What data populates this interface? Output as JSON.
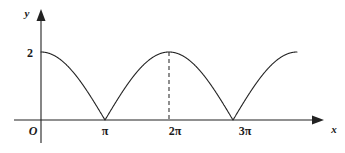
{
  "figure": {
    "background_color": "#ffffff",
    "curve_color": "#222222",
    "axis_color": "#222222",
    "guide_color": "#333333"
  },
  "axes": {
    "y_axis_label": "y",
    "x_axis_label": "x",
    "origin_label": "O"
  },
  "y_ticks": [
    {
      "label": "2",
      "value": 2
    }
  ],
  "x_ticks": [
    {
      "label": "π",
      "value": 3.14159
    },
    {
      "label": "2π",
      "value": 6.28319
    },
    {
      "label": "3π",
      "value": 9.42478
    }
  ],
  "annotations": [
    {
      "name": "peak-guide-line",
      "type": "dashed-vertical",
      "x": 6.28319,
      "y_from": 0,
      "y_to": 2
    }
  ],
  "chart_data": {
    "type": "line",
    "title": "",
    "subtitle": "",
    "xlabel": "x",
    "ylabel": "y",
    "xlim": [
      0,
      12.566
    ],
    "ylim": [
      0,
      2.35
    ],
    "grid": false,
    "legend": "none",
    "function": "y = 2|cos(x/2)|",
    "xtick_labels": [
      "π",
      "2π",
      "3π"
    ],
    "xtick_values": [
      3.14159,
      6.28319,
      9.42478
    ],
    "ytick_labels": [
      "2"
    ],
    "ytick_values": [
      2
    ],
    "series": [
      {
        "name": "y = 2|cos(x/2)|",
        "color": "#222222",
        "x": [
          0.0,
          0.3142,
          0.6283,
          0.9425,
          1.2566,
          1.5708,
          1.885,
          2.1991,
          2.5133,
          2.8274,
          3.1416,
          3.4558,
          3.7699,
          4.0841,
          4.3982,
          4.7124,
          5.0265,
          5.3407,
          5.6549,
          5.969,
          6.2832,
          6.5973,
          6.9115,
          7.2257,
          7.5398,
          7.854,
          8.1681,
          8.4823,
          8.7965,
          9.1106,
          9.4248,
          9.739,
          10.0531,
          10.3673,
          10.6814,
          10.9956,
          11.3097,
          11.6239,
          11.9381,
          12.2522,
          12.5664
        ],
        "y": [
          2.0,
          1.9754,
          1.9021,
          1.782,
          1.618,
          1.4142,
          1.1756,
          0.908,
          0.618,
          0.3129,
          0.0,
          0.3129,
          0.618,
          0.908,
          1.1756,
          1.4142,
          1.618,
          1.782,
          1.9021,
          1.9754,
          2.0,
          1.9754,
          1.9021,
          1.782,
          1.618,
          1.4142,
          1.1756,
          0.908,
          0.618,
          0.3129,
          0.0,
          0.3129,
          0.618,
          0.908,
          1.1756,
          1.4142,
          1.618,
          1.782,
          1.9021,
          1.9754,
          2.0
        ]
      }
    ],
    "annotations": [
      {
        "text": "",
        "type": "dashed-vertical-line",
        "x": 6.28319,
        "y_from": 0,
        "y_to": 2
      }
    ]
  }
}
